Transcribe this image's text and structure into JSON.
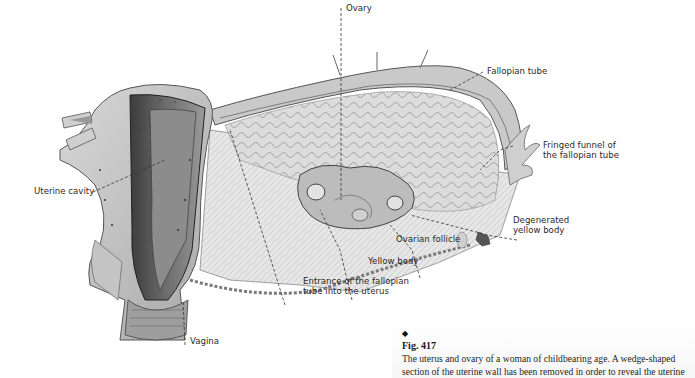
{
  "figure": {
    "labels": [
      {
        "id": "ovary",
        "text": "Ovary"
      },
      {
        "id": "fallopian-tube",
        "text": "Fallopian tube"
      },
      {
        "id": "fringed-funnel",
        "line1": "Fringed funnel of",
        "line2": "the fallopian tube"
      },
      {
        "id": "uterine-cavity",
        "text": "Uterine cavity"
      },
      {
        "id": "degenerated-yellow-body",
        "line1": "Degenerated",
        "line2": "yellow body"
      },
      {
        "id": "ovarian-follicle",
        "text": "Ovarian follicle"
      },
      {
        "id": "yellow-body",
        "text": "Yellow body"
      },
      {
        "id": "tube-entrance",
        "line1": "Entrance of the fallopian",
        "line2": "tube into the uterus"
      },
      {
        "id": "vagina",
        "text": "Vagina"
      }
    ]
  },
  "caption": {
    "bullet": "◆",
    "figure_number": "Fig. 417",
    "lines": [
      "The uterus and ovary of a woman of childbearing age.  A wedge-shaped",
      "section of the uterine wall has been removed in order to reveal the uterine"
    ]
  },
  "colors": {
    "background": "#ffffff",
    "label_text": "#2a2a2a",
    "leader_line": "#333333",
    "illustration_mid": "#b8b8b8",
    "illustration_dark": "#4a4a4a"
  }
}
